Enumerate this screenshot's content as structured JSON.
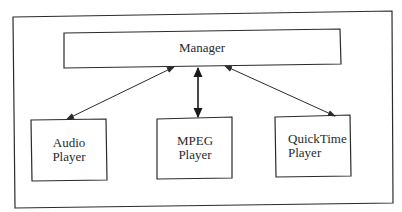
{
  "diagram": {
    "type": "architecture",
    "colors": {
      "stroke": "#2b2b2b",
      "background": "#ffffff",
      "text": "#2a2a2a"
    },
    "nodes": [
      {
        "id": "manager",
        "label": "Manager",
        "lines": [
          "Manager"
        ]
      },
      {
        "id": "audio",
        "label": "Audio Player",
        "lines": [
          "Audio",
          "Player"
        ]
      },
      {
        "id": "mpeg",
        "label": "MPEG Player",
        "lines": [
          "MPEG",
          "Player"
        ]
      },
      {
        "id": "quicktime",
        "label": "QuickTime Player",
        "lines": [
          "QuickTime",
          "Player"
        ]
      }
    ],
    "edges": [
      {
        "from": "manager",
        "to": "audio",
        "direction": "bidirectional"
      },
      {
        "from": "manager",
        "to": "mpeg",
        "direction": "bidirectional"
      },
      {
        "from": "manager",
        "to": "quicktime",
        "direction": "bidirectional"
      }
    ]
  }
}
